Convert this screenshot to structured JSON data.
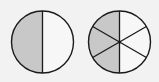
{
  "diagram": {
    "colors": {
      "background": "#f2f2f2",
      "shaded": "#c8c8c8",
      "unshaded": "#f7f7f7",
      "stroke": "#1a1a1a"
    },
    "circles": [
      {
        "id": "halves",
        "parts": 2,
        "shaded_parts": 1,
        "fraction": "1/2"
      },
      {
        "id": "sixths",
        "parts": 6,
        "shaded_parts": 3,
        "fraction": "3/6"
      }
    ]
  }
}
